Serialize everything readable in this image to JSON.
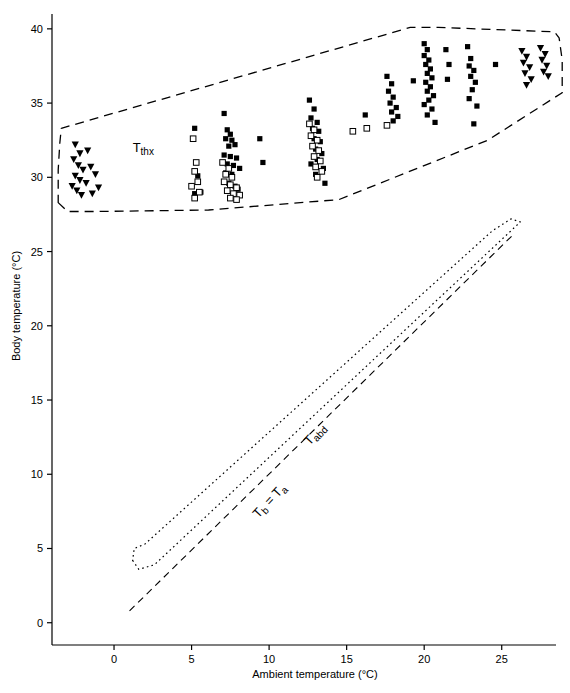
{
  "chart_data": {
    "type": "scatter",
    "title": "",
    "xlabel": "Ambient temperature (°C)",
    "ylabel": "Body temperature (°C)",
    "xlim": [
      -4,
      28.5
    ],
    "ylim": [
      -1.5,
      41
    ],
    "xticks": [
      0,
      5,
      10,
      15,
      20,
      25
    ],
    "yticks": [
      0,
      5,
      10,
      15,
      20,
      25,
      30,
      35,
      40
    ],
    "xticklabels": [
      "0",
      "5",
      "10",
      "15",
      "20",
      "25"
    ],
    "yticklabels": [
      "0",
      "5",
      "10",
      "15",
      "20",
      "25",
      "30",
      "35",
      "40"
    ],
    "grid": false,
    "legend": null,
    "annotations": [
      {
        "name": "thorax-envelope-label",
        "text": "T",
        "sub": "thx",
        "x": 1.2,
        "y": 31.7
      },
      {
        "name": "abdomen-envelope-label",
        "text": "T",
        "sub": "abd",
        "x": 12.6,
        "y": 11.9,
        "rotation": -47
      },
      {
        "name": "equality-line-label",
        "text": "T",
        "sub": "b",
        "mid": " = T",
        "sub2": "a",
        "x": 9.3,
        "y": 7.0,
        "rotation": -47
      }
    ],
    "lines": [
      {
        "name": "tb-equals-ta-line",
        "style": "dashed",
        "points": [
          [
            1.0,
            0.8
          ],
          [
            25.8,
            26.2
          ]
        ]
      }
    ],
    "series": [
      {
        "name": "thorax-temperature-filled-squares",
        "marker": "filled-square",
        "points": [
          [
            5.2,
            33.3
          ],
          [
            5.4,
            30.1
          ],
          [
            5.2,
            28.9
          ],
          [
            5.6,
            29.0
          ],
          [
            7.1,
            34.3
          ],
          [
            7.3,
            33.2
          ],
          [
            7.5,
            32.9
          ],
          [
            7.2,
            32.6
          ],
          [
            7.6,
            32.5
          ],
          [
            7.4,
            32.1
          ],
          [
            7.8,
            32.2
          ],
          [
            7.1,
            31.5
          ],
          [
            7.5,
            31.4
          ],
          [
            7.9,
            31.3
          ],
          [
            7.3,
            30.9
          ],
          [
            7.7,
            30.8
          ],
          [
            8.1,
            30.6
          ],
          [
            7.2,
            30.3
          ],
          [
            7.6,
            30.2
          ],
          [
            7.4,
            29.6
          ],
          [
            7.8,
            29.4
          ],
          [
            8.0,
            29.2
          ],
          [
            9.4,
            32.6
          ],
          [
            9.6,
            31.0
          ],
          [
            12.6,
            35.2
          ],
          [
            12.9,
            34.6
          ],
          [
            12.7,
            34.0
          ],
          [
            13.1,
            33.7
          ],
          [
            12.8,
            33.3
          ],
          [
            13.2,
            33.1
          ],
          [
            12.9,
            32.6
          ],
          [
            13.3,
            32.4
          ],
          [
            13.0,
            31.9
          ],
          [
            13.4,
            31.6
          ],
          [
            13.1,
            31.2
          ],
          [
            12.7,
            30.9
          ],
          [
            13.5,
            30.6
          ],
          [
            13.0,
            30.2
          ],
          [
            13.6,
            29.6
          ],
          [
            16.2,
            34.2
          ],
          [
            17.6,
            36.8
          ],
          [
            17.9,
            36.3
          ],
          [
            17.7,
            35.8
          ],
          [
            18.0,
            35.4
          ],
          [
            17.8,
            35.0
          ],
          [
            18.2,
            34.7
          ],
          [
            17.9,
            34.4
          ],
          [
            18.3,
            34.1
          ],
          [
            18.0,
            33.8
          ],
          [
            19.3,
            36.5
          ],
          [
            20.0,
            39.0
          ],
          [
            20.2,
            38.6
          ],
          [
            20.0,
            38.2
          ],
          [
            20.3,
            37.9
          ],
          [
            20.1,
            37.6
          ],
          [
            20.4,
            37.3
          ],
          [
            20.2,
            37.0
          ],
          [
            20.5,
            36.7
          ],
          [
            20.1,
            36.4
          ],
          [
            20.4,
            36.1
          ],
          [
            20.2,
            35.8
          ],
          [
            20.6,
            35.5
          ],
          [
            20.3,
            35.2
          ],
          [
            20.0,
            34.9
          ],
          [
            20.5,
            34.6
          ],
          [
            20.2,
            34.2
          ],
          [
            20.7,
            33.7
          ],
          [
            21.4,
            38.6
          ],
          [
            21.6,
            37.6
          ],
          [
            21.5,
            36.6
          ],
          [
            22.8,
            38.8
          ],
          [
            23.0,
            38.0
          ],
          [
            22.9,
            37.5
          ],
          [
            23.2,
            37.2
          ],
          [
            23.0,
            36.8
          ],
          [
            23.3,
            36.4
          ],
          [
            23.1,
            35.9
          ],
          [
            22.9,
            35.3
          ],
          [
            23.4,
            34.8
          ],
          [
            23.2,
            33.6
          ],
          [
            24.6,
            37.6
          ]
        ]
      },
      {
        "name": "abdomen-temperature-open-squares",
        "marker": "open-square",
        "points": [
          [
            5.1,
            32.6
          ],
          [
            5.3,
            31.0
          ],
          [
            5.2,
            30.4
          ],
          [
            5.4,
            29.7
          ],
          [
            5.0,
            29.4
          ],
          [
            5.5,
            29.0
          ],
          [
            5.2,
            28.6
          ],
          [
            7.0,
            31.0
          ],
          [
            7.4,
            30.6
          ],
          [
            7.2,
            30.2
          ],
          [
            7.6,
            30.0
          ],
          [
            7.1,
            29.7
          ],
          [
            7.5,
            29.5
          ],
          [
            7.9,
            29.3
          ],
          [
            7.3,
            29.1
          ],
          [
            7.7,
            28.9
          ],
          [
            8.1,
            28.8
          ],
          [
            7.5,
            28.6
          ],
          [
            7.9,
            28.5
          ],
          [
            12.6,
            33.6
          ],
          [
            12.9,
            33.2
          ],
          [
            12.7,
            32.8
          ],
          [
            13.1,
            32.5
          ],
          [
            12.8,
            32.1
          ],
          [
            13.2,
            31.8
          ],
          [
            12.9,
            31.4
          ],
          [
            13.3,
            31.1
          ],
          [
            13.0,
            30.7
          ],
          [
            13.4,
            30.4
          ],
          [
            13.1,
            30.0
          ],
          [
            15.4,
            33.1
          ],
          [
            16.3,
            33.3
          ],
          [
            17.6,
            33.5
          ]
        ]
      },
      {
        "name": "thorax-temperature-filled-triangles",
        "marker": "filled-triangle-down",
        "points": [
          [
            -2.5,
            32.2
          ],
          [
            -2.2,
            31.6
          ],
          [
            -2.6,
            31.2
          ],
          [
            -2.3,
            30.8
          ],
          [
            -2.0,
            30.5
          ],
          [
            -2.5,
            30.1
          ],
          [
            -2.2,
            29.8
          ],
          [
            -2.7,
            29.4
          ],
          [
            -2.4,
            29.1
          ],
          [
            -2.1,
            28.8
          ],
          [
            -1.7,
            31.8
          ],
          [
            -1.5,
            30.7
          ],
          [
            -1.8,
            29.6
          ],
          [
            -1.4,
            28.9
          ],
          [
            -1.2,
            30.2
          ],
          [
            -1.0,
            29.3
          ],
          [
            26.3,
            38.5
          ],
          [
            26.6,
            38.1
          ],
          [
            26.4,
            37.7
          ],
          [
            26.8,
            37.4
          ],
          [
            26.5,
            37.0
          ],
          [
            26.9,
            36.6
          ],
          [
            26.6,
            36.2
          ],
          [
            27.5,
            38.7
          ],
          [
            27.8,
            38.3
          ],
          [
            27.6,
            37.9
          ],
          [
            27.9,
            37.5
          ],
          [
            27.7,
            37.1
          ],
          [
            28.0,
            36.8
          ]
        ]
      }
    ]
  }
}
